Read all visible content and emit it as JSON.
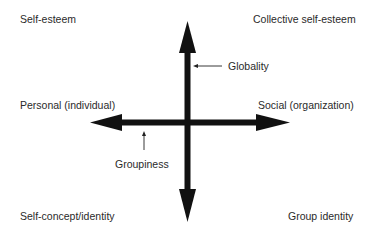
{
  "diagram": {
    "type": "quadrant",
    "colors": {
      "background": "#ffffff",
      "arrow": "#111111",
      "text": "#2a2a2a"
    },
    "corners": {
      "top_left": "Self-esteem",
      "top_right": "Collective self-esteem",
      "bottom_left": "Self-concept/identity",
      "bottom_right": "Group identity"
    },
    "axes": {
      "horizontal": {
        "left_label": "Personal (individual)",
        "right_label": "Social (organization)",
        "pointer_label": "Groupiness"
      },
      "vertical": {
        "pointer_label": "Globality"
      }
    },
    "icons": {
      "vertical_axis": "double-headed-arrow-vertical",
      "horizontal_axis": "double-headed-arrow-horizontal",
      "globality_pointer": "arrow-left-thin",
      "groupiness_pointer": "arrow-up-thin"
    }
  }
}
